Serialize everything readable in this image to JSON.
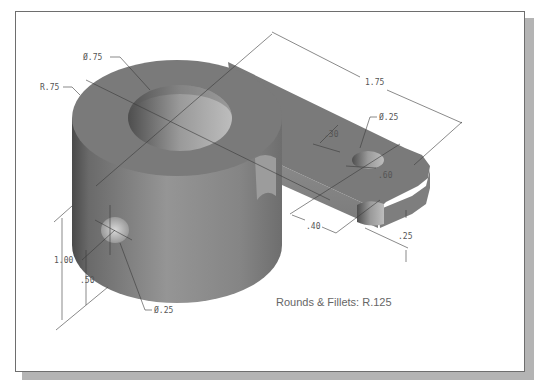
{
  "drawing": {
    "note": "Rounds & Fillets: R.125",
    "dimensions": {
      "bore_diameter": "Ø.75",
      "outer_radius": "R.75",
      "overall_length": "1.75",
      "arm_hole_diameter": "Ø.25",
      "arm_hole_offset": ".30",
      "arm_width": ".60",
      "arm_hole_position": ".40",
      "arm_thickness": ".25",
      "height": "1.00",
      "side_hole_height": ".50",
      "side_hole_diameter": "Ø.25"
    }
  },
  "colors": {
    "part_top": "#7a7a7a",
    "part_side": "#8c8c8c",
    "dimension_line": "#3a3a3a",
    "frame_border": "#6e6e6e",
    "shadow": "#b4b4b4"
  }
}
